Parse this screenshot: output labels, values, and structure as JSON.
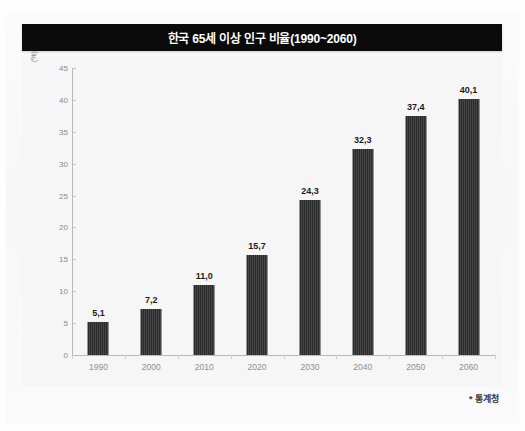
{
  "figure": {
    "title": "한국 65세 이상 인구 비율(1990~2060)",
    "source_note": "* 통계청",
    "background_color": "#f6f6f6",
    "title_bar_color": "#0b0b0b",
    "bar_color": "#2b2b2b"
  },
  "chart_data": {
    "type": "bar",
    "title": "한국 65세 이상 인구 비율(1990~2060)",
    "xlabel": "",
    "ylabel": "(%)",
    "categories": [
      "1990",
      "2000",
      "2010",
      "2020",
      "2030",
      "2040",
      "2050",
      "2060"
    ],
    "values": [
      5.1,
      7.2,
      11.0,
      15.7,
      24.3,
      32.3,
      37.4,
      40.1
    ],
    "value_labels": [
      "5,1",
      "7,2",
      "11,0",
      "15,7",
      "24,3",
      "32,3",
      "37,4",
      "40,1"
    ],
    "ylim": [
      0,
      45
    ],
    "yticks": [
      0,
      5,
      10,
      15,
      20,
      25,
      30,
      35,
      40,
      45
    ],
    "ytick_labels": [
      "0",
      "5",
      "10",
      "15",
      "20",
      "25",
      "30",
      "35",
      "40",
      "45"
    ],
    "grid": false,
    "legend": null,
    "annotations": [
      "* 통계청"
    ]
  }
}
